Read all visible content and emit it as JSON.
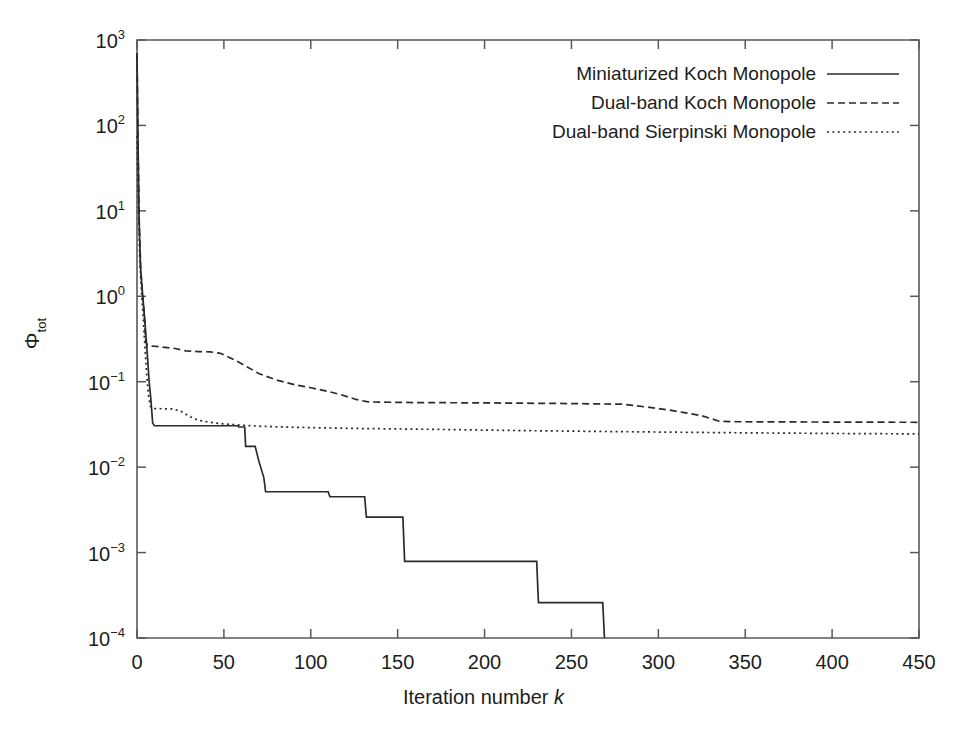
{
  "chart_data": {
    "type": "line",
    "title": "",
    "xlabel": "Iteration number k",
    "ylabel": "Φ_tot",
    "yscale": "log",
    "xlim": [
      0,
      450
    ],
    "ylim": [
      0.0001,
      1000
    ],
    "grid": false,
    "legend_position": "top-right-inside",
    "xticks": [
      0,
      50,
      100,
      150,
      200,
      250,
      300,
      350,
      400,
      450
    ],
    "xtick_labels": [
      "0",
      "50",
      "100",
      "150",
      "200",
      "250",
      "300",
      "350",
      "400",
      "450"
    ],
    "yticks": [
      0.0001,
      0.001,
      0.01,
      0.1,
      1,
      10,
      100,
      1000
    ],
    "ytick_labels": [
      "10-4",
      "10-3",
      "10-2",
      "10-1",
      "100",
      "101",
      "102",
      "103"
    ],
    "series": [
      {
        "name": "Miniaturized Koch Monopole",
        "style": "solid",
        "color": "#2b2b2b",
        "points": [
          [
            0,
            700
          ],
          [
            0.6,
            60
          ],
          [
            1.2,
            8
          ],
          [
            2,
            2.2
          ],
          [
            3,
            1.2
          ],
          [
            4.5,
            0.52
          ],
          [
            6,
            0.2
          ],
          [
            7,
            0.1
          ],
          [
            8,
            0.062
          ],
          [
            9,
            0.033
          ],
          [
            10,
            0.0305
          ],
          [
            58,
            0.0305
          ],
          [
            58.5,
            0.0295
          ],
          [
            62,
            0.0295
          ],
          [
            62.5,
            0.0175
          ],
          [
            68,
            0.0175
          ],
          [
            70,
            0.012
          ],
          [
            73,
            0.0075
          ],
          [
            74,
            0.00515
          ],
          [
            110,
            0.00515
          ],
          [
            111,
            0.0045
          ],
          [
            131,
            0.0045
          ],
          [
            132,
            0.0026
          ],
          [
            153,
            0.0026
          ],
          [
            154,
            0.00079
          ],
          [
            230,
            0.00079
          ],
          [
            231,
            0.00026
          ],
          [
            268,
            0.00026
          ],
          [
            269,
            0.0001
          ]
        ]
      },
      {
        "name": "Dual-band Koch Monopole",
        "style": "dashed",
        "color": "#2b2b2b",
        "points": [
          [
            0,
            700
          ],
          [
            0.6,
            55
          ],
          [
            1.3,
            7
          ],
          [
            2.2,
            2.0
          ],
          [
            3.2,
            1.05
          ],
          [
            4.2,
            0.62
          ],
          [
            5,
            0.3
          ],
          [
            6,
            0.265
          ],
          [
            14,
            0.255
          ],
          [
            22,
            0.245
          ],
          [
            28,
            0.23
          ],
          [
            35,
            0.225
          ],
          [
            42,
            0.224
          ],
          [
            48,
            0.215
          ],
          [
            55,
            0.185
          ],
          [
            62,
            0.155
          ],
          [
            70,
            0.125
          ],
          [
            80,
            0.105
          ],
          [
            90,
            0.093
          ],
          [
            100,
            0.085
          ],
          [
            110,
            0.077
          ],
          [
            118,
            0.07
          ],
          [
            126,
            0.062
          ],
          [
            133,
            0.058
          ],
          [
            160,
            0.057
          ],
          [
            200,
            0.0565
          ],
          [
            250,
            0.0555
          ],
          [
            280,
            0.0545
          ],
          [
            295,
            0.05
          ],
          [
            305,
            0.047
          ],
          [
            315,
            0.0435
          ],
          [
            325,
            0.04
          ],
          [
            335,
            0.0345
          ],
          [
            345,
            0.034
          ],
          [
            380,
            0.0338
          ],
          [
            450,
            0.0335
          ]
        ]
      },
      {
        "name": "Dual-band Sierpinski Monopole",
        "style": "dotted",
        "color": "#2b2b2b",
        "points": [
          [
            0,
            75
          ],
          [
            0.8,
            12
          ],
          [
            1.6,
            2.6
          ],
          [
            2.6,
            1.1
          ],
          [
            3.6,
            0.55
          ],
          [
            4.6,
            0.25
          ],
          [
            5.6,
            0.12
          ],
          [
            6.6,
            0.07
          ],
          [
            7.6,
            0.052
          ],
          [
            9,
            0.0485
          ],
          [
            20,
            0.048
          ],
          [
            25,
            0.0455
          ],
          [
            30,
            0.0395
          ],
          [
            35,
            0.0355
          ],
          [
            42,
            0.0335
          ],
          [
            50,
            0.032
          ],
          [
            60,
            0.031
          ],
          [
            72,
            0.03
          ],
          [
            85,
            0.0295
          ],
          [
            100,
            0.029
          ],
          [
            130,
            0.0283
          ],
          [
            170,
            0.0277
          ],
          [
            220,
            0.0268
          ],
          [
            280,
            0.026
          ],
          [
            340,
            0.0253
          ],
          [
            400,
            0.0248
          ],
          [
            450,
            0.0245
          ]
        ]
      }
    ]
  },
  "axes": {
    "x_title_prefix": "Iteration number ",
    "x_title_var": "k",
    "y_title_base": "Φ",
    "y_title_sub": "tot"
  },
  "legend": {
    "entries": [
      {
        "label": "Miniaturized Koch Monopole",
        "style": "solid"
      },
      {
        "label": "Dual-band Koch Monopole",
        "style": "dashed"
      },
      {
        "label": "Dual-band Sierpinski Monopole",
        "style": "dotted"
      }
    ]
  }
}
